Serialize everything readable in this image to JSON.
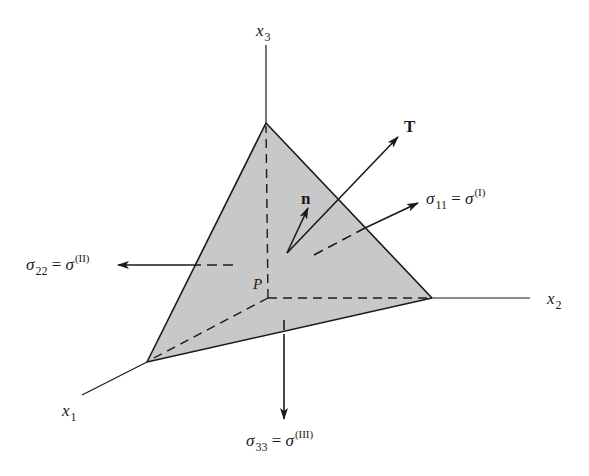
{
  "figure": {
    "type": "3D stress tetrahedron at point P",
    "colors": {
      "face_fill": "#c8c8c8",
      "line": "#1a1a1a",
      "background": "#ffffff"
    },
    "axes": [
      {
        "id": "x1",
        "var": "x",
        "sub": "1"
      },
      {
        "id": "x2",
        "var": "x",
        "sub": "2"
      },
      {
        "id": "x3",
        "var": "x",
        "sub": "3"
      }
    ],
    "point": {
      "label": "P"
    },
    "vectors": {
      "traction": {
        "label": "T"
      },
      "normal": {
        "label": "n"
      }
    },
    "stresses": [
      {
        "id": "s11",
        "sym": "σ",
        "sub": "11",
        "eq": "=",
        "rhs": "σ",
        "sup": "(I)"
      },
      {
        "id": "s22",
        "sym": "σ",
        "sub": "22",
        "eq": "=",
        "rhs": "σ",
        "sup": "(II)"
      },
      {
        "id": "s33",
        "sym": "σ",
        "sub": "33",
        "eq": "=",
        "rhs": "σ",
        "sup": "(III)"
      }
    ]
  }
}
